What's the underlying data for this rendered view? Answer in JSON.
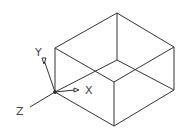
{
  "diagram": {
    "type": "isometric-box",
    "line_color": "#333333",
    "axes": {
      "x_label": "X",
      "y_label": "Y",
      "z_label": "Z"
    }
  }
}
